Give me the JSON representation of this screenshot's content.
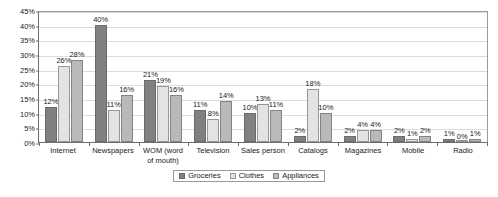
{
  "chart_data": {
    "type": "bar",
    "title": "",
    "subtitle": "",
    "xlabel": "",
    "ylabel": "",
    "ylim": [
      0,
      45
    ],
    "ytick_step": 5,
    "ytick_labels": [
      "0%",
      "5%",
      "10%",
      "15%",
      "20%",
      "25%",
      "30%",
      "35%",
      "40%",
      "45%"
    ],
    "grid": true,
    "legend_position": "bottom",
    "value_suffix": "%",
    "categories": [
      "Internet",
      "Newspapers",
      "WOM (word\nof mouth)",
      "Television",
      "Sales person",
      "Catalogs",
      "Magazines",
      "Mobile",
      "Radio"
    ],
    "series": [
      {
        "name": "Groceries",
        "color": "#808080",
        "values": [
          12,
          40,
          21,
          11,
          10,
          2,
          2,
          2,
          1
        ],
        "labels": [
          "12%",
          "40%",
          "21%",
          "11%",
          "10%",
          "2%",
          "2%",
          "2%",
          "1%"
        ]
      },
      {
        "name": "Clothes",
        "color": "#e3e3e3",
        "values": [
          26,
          11,
          19,
          8,
          13,
          18,
          4,
          1,
          0
        ],
        "labels": [
          "26%",
          "11%",
          "19%",
          "8%",
          "13%",
          "18%",
          "4%",
          "1%",
          "0%"
        ]
      },
      {
        "name": "Appliances",
        "color": "#b9b9b9",
        "values": [
          28,
          16,
          16,
          14,
          11,
          10,
          4,
          2,
          1
        ],
        "labels": [
          "28%",
          "16%",
          "16%",
          "14%",
          "11%",
          "10%",
          "4%",
          "2%",
          "1%"
        ]
      }
    ]
  }
}
